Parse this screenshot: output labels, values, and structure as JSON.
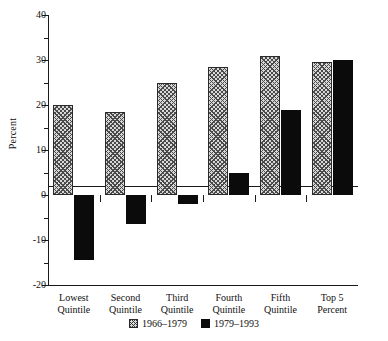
{
  "chart_data": {
    "type": "bar",
    "title": "",
    "xlabel": "",
    "ylabel": "Percent",
    "ylim": [
      -20,
      40
    ],
    "grid": false,
    "legend_position": "bottom-center",
    "categories": [
      "Lowest Quintile",
      "Second Quintile",
      "Third Quintile",
      "Fourth Quintile",
      "Fifth Quintile",
      "Top 5 Percent"
    ],
    "category_lines": [
      [
        "Lowest",
        "Quintile"
      ],
      [
        "Second",
        "Quintile"
      ],
      [
        "Third",
        "Quintile"
      ],
      [
        "Fourth",
        "Quintile"
      ],
      [
        "Fifth",
        "Quintile"
      ],
      [
        "Top 5",
        "Percent"
      ]
    ],
    "series": [
      {
        "name": "1966–1979",
        "fill": "hatched",
        "color": "#d8d8d8",
        "values": [
          20.0,
          18.5,
          25.0,
          28.5,
          31.0,
          29.5
        ]
      },
      {
        "name": "1979–1993",
        "fill": "solid",
        "color": "#0b0b0b",
        "values": [
          -14.5,
          -6.5,
          -2.0,
          5.0,
          19.0,
          30.0
        ]
      }
    ],
    "y_ticks_major": [
      40,
      30,
      20,
      10,
      0,
      -10,
      -20
    ],
    "y_tick_labels": [
      "40",
      "30",
      "20",
      "10",
      "0",
      "-10",
      "-20"
    ],
    "y_ticks_minor": [
      35,
      25,
      15,
      5,
      -5,
      -15
    ]
  }
}
